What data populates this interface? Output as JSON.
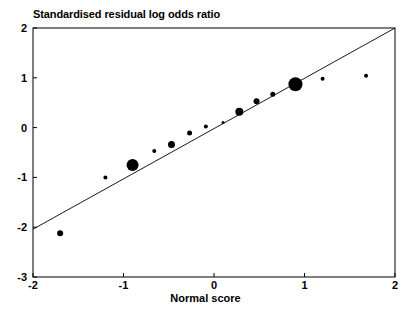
{
  "chart_data": {
    "type": "scatter",
    "title": "Standardised residual log odds ratio",
    "xlabel": "Normal score",
    "ylabel": "",
    "xlim": [
      -2,
      2
    ],
    "ylim": [
      -3,
      2
    ],
    "grid": false,
    "legend": null,
    "xticks": [
      "-2",
      "-1",
      "0",
      "1",
      "2"
    ],
    "xtick_values": [
      -2,
      -1,
      0,
      1,
      2
    ],
    "yticks": [
      "2",
      "1",
      "0",
      "-1",
      "-2",
      "-3"
    ],
    "ytick_values": [
      2,
      1,
      0,
      -1,
      -2,
      -3
    ],
    "marker_color": "#000000",
    "line_color": "#000000",
    "axis_color": "#000000",
    "reference_line": {
      "name": "fitted-regression-line",
      "x": [
        -2,
        2
      ],
      "y": [
        -2.04,
        2.0
      ]
    },
    "points": [
      {
        "x": -1.7,
        "y": -2.12,
        "size": 3.0
      },
      {
        "x": -1.2,
        "y": -1.0,
        "size": 2.0
      },
      {
        "x": -0.9,
        "y": -0.75,
        "size": 6.0
      },
      {
        "x": -0.66,
        "y": -0.47,
        "size": 2.0
      },
      {
        "x": -0.47,
        "y": -0.34,
        "size": 3.5
      },
      {
        "x": -0.27,
        "y": -0.11,
        "size": 2.5
      },
      {
        "x": -0.09,
        "y": 0.02,
        "size": 2.0
      },
      {
        "x": 0.1,
        "y": 0.1,
        "size": 1.5
      },
      {
        "x": 0.28,
        "y": 0.32,
        "size": 4.0
      },
      {
        "x": 0.47,
        "y": 0.53,
        "size": 3.0
      },
      {
        "x": 0.65,
        "y": 0.67,
        "size": 2.5
      },
      {
        "x": 0.9,
        "y": 0.87,
        "size": 7.0
      },
      {
        "x": 1.2,
        "y": 0.98,
        "size": 2.0
      },
      {
        "x": 1.68,
        "y": 1.04,
        "size": 2.0
      }
    ]
  }
}
